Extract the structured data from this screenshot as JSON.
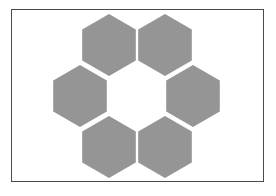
{
  "diagram": {
    "type": "hexagon-ring",
    "hexagon_count": 6,
    "hexagon_fill": "#959595",
    "border_color": "#4a4a4a",
    "background": "#ffffff",
    "hexagons": [
      {
        "name": "top-left",
        "cx": 109,
        "cy": 45
      },
      {
        "name": "top-right",
        "cx": 165,
        "cy": 45
      },
      {
        "name": "middle-left",
        "cx": 80,
        "cy": 96
      },
      {
        "name": "middle-right",
        "cx": 193,
        "cy": 96
      },
      {
        "name": "bottom-left",
        "cx": 109,
        "cy": 147
      },
      {
        "name": "bottom-right",
        "cx": 165,
        "cy": 147
      }
    ]
  }
}
